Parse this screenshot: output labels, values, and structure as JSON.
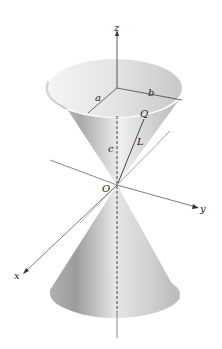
{
  "figure": {
    "labels": {
      "z_axis": "z",
      "y_axis": "y",
      "x_axis": "x",
      "origin": "O",
      "radius_a": "a",
      "radius_b": "b",
      "point_q": "Q",
      "slant_l": "L",
      "height_c": "c"
    },
    "colors": {
      "axis": "#333333",
      "cone_light": "#f2f2f2",
      "cone_dark": "#9a9a9a",
      "background": "#ffffff"
    }
  }
}
